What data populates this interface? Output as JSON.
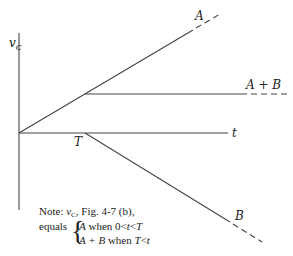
{
  "diagram": {
    "axes": {
      "y_label": "v",
      "y_label_sub": "C",
      "x_label": "t"
    },
    "markers": {
      "breakpoint_label": "T"
    },
    "curves": {
      "a_label": "A",
      "a_plus_b_label": "A + B",
      "b_label": "B"
    },
    "note": {
      "line1_prefix": "Note: ",
      "line1_var": "v",
      "line1_sub": "C",
      "line1_suffix": ", Fig. 4-7 (b),",
      "equals": "equals",
      "case1_var": "A",
      "case1_text": " when 0<",
      "case1_cond_t": "t",
      "case1_lt": "<",
      "case1_T": "T",
      "case2_var": "A + B",
      "case2_text": " when ",
      "case2_T": "T",
      "case2_lt": "<",
      "case2_t": "t"
    }
  }
}
